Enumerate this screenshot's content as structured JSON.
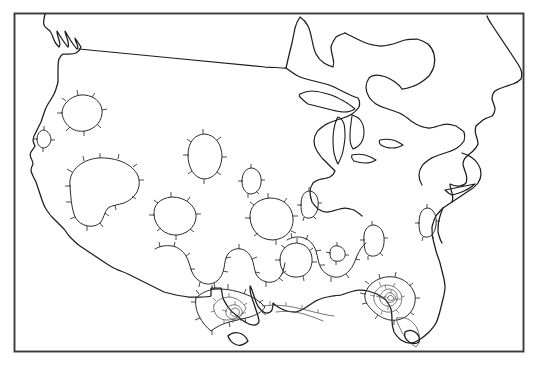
{
  "figure": {
    "kind": "contour-map",
    "title": "",
    "subtitle": "",
    "region_label": "Continental United States",
    "background_color": "#ffffff",
    "frame_color": "#3a3a3a",
    "coastline_color": "#1c1c1c",
    "contour_color": "#2b2b2b",
    "inner_contour_color": "#4a4a4a",
    "has_axis_labels": false,
    "has_tick_labels": false,
    "has_legend": false,
    "has_colorbar": false,
    "has_text_annotations": false
  },
  "frame": {
    "x": 14,
    "y": 13,
    "width": 510,
    "height": 339,
    "stroke_width": 1.9
  },
  "chart_data": {
    "type": "heatmap",
    "render_style": "contour-lines-with-hachures",
    "title": "",
    "subtitle": "",
    "xlabel": "",
    "ylabel": "",
    "grid": false,
    "legend": false,
    "legend_position": "none",
    "projection": "conic-continental-us",
    "xlim": [
      14,
      524
    ],
    "ylim": [
      13,
      352
    ],
    "tick_labels_x": [],
    "tick_labels_y": [],
    "annotations": [],
    "contour_style": {
      "closed_contours": true,
      "hachure_marks": true,
      "hachure_direction": "outward",
      "hachure_meaning": "tick marks on closed contours",
      "line_weight_primary": 1.0,
      "line_weight_inner": 0.75
    },
    "maxima_centers": [
      {
        "name": "south-texas-maximum",
        "x": 238,
        "y": 313,
        "nested_rings": 4,
        "relative_intensity": 1.0
      },
      {
        "name": "north-florida-maximum",
        "x": 395,
        "y": 297,
        "nested_rings": 5,
        "relative_intensity": 1.0
      }
    ],
    "closed_contour_cells": [
      {
        "name": "pacific-northwest-cell",
        "cx": 80,
        "cy": 113,
        "rx": 22,
        "ry": 16,
        "rings": 1
      },
      {
        "name": "california-coast-cell",
        "cx": 43,
        "cy": 139,
        "rx": 7,
        "ry": 9,
        "rings": 1
      },
      {
        "name": "great-basin-cell",
        "cx": 103,
        "cy": 183,
        "rx": 36,
        "ry": 25,
        "rings": 1
      },
      {
        "name": "northern-rockies-cell",
        "cx": 204,
        "cy": 157,
        "rx": 18,
        "ry": 22,
        "rings": 1
      },
      {
        "name": "central-plains-cell",
        "cx": 251,
        "cy": 181,
        "rx": 10,
        "ry": 13,
        "rings": 1
      },
      {
        "name": "southern-rockies-cell",
        "cx": 175,
        "cy": 216,
        "rx": 22,
        "ry": 19,
        "rings": 1
      },
      {
        "name": "midcontinent-cell",
        "cx": 271,
        "cy": 219,
        "rx": 22,
        "ry": 21,
        "rings": 1
      },
      {
        "name": "ohio-valley-cell",
        "cx": 309,
        "cy": 205,
        "rx": 8,
        "ry": 12,
        "rings": 1
      },
      {
        "name": "appalachian-cell",
        "cx": 374,
        "cy": 240,
        "rx": 11,
        "ry": 14,
        "rings": 1
      },
      {
        "name": "carolina-cell",
        "cx": 427,
        "cy": 223,
        "rx": 9,
        "ry": 13,
        "rings": 1
      },
      {
        "name": "gulf-interior-cell",
        "cx": 296,
        "cy": 260,
        "rx": 17,
        "ry": 17,
        "rings": 1
      },
      {
        "name": "mississippi-cell",
        "cx": 338,
        "cy": 253,
        "rx": 8,
        "ry": 6,
        "rings": 1
      }
    ],
    "value_note": "unlabeled isolines; no numeric contour labels rendered"
  },
  "elements": {
    "frame_name": "map-frame",
    "coastline_name": "us-coastline",
    "lakes_name": "great-lakes",
    "contours_name": "contour-lines",
    "hachures_name": "hachure-ticks"
  }
}
